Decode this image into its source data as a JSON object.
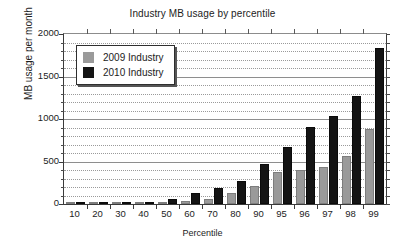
{
  "chart_data": {
    "type": "bar",
    "title": "Industry MB usage by percentile",
    "xlabel": "Percentile",
    "ylabel": "MB usage per month",
    "categories": [
      "10",
      "20",
      "30",
      "40",
      "50",
      "60",
      "70",
      "80",
      "90",
      "95",
      "96",
      "97",
      "98",
      "99"
    ],
    "series": [
      {
        "name": "2009 Industry",
        "color": "#9a9a9a",
        "values": [
          3,
          5,
          9,
          14,
          22,
          33,
          55,
          125,
          210,
          375,
          405,
          435,
          570,
          880
        ]
      },
      {
        "name": "2010 Industry",
        "color": "#141414",
        "values": [
          5,
          8,
          18,
          28,
          60,
          125,
          190,
          270,
          465,
          670,
          910,
          1035,
          1265,
          1830
        ]
      }
    ],
    "ylim": [
      0,
      2000
    ],
    "y_major_ticks": [
      0,
      500,
      1000,
      1500,
      2000
    ],
    "y_minor_tick_step": 100,
    "grid": {
      "major_horizontal": true,
      "minor_horizontal_dotted": true,
      "vertical": false
    },
    "legend": {
      "position": "upper-left-inside",
      "entries": [
        "2009 Industry",
        "2010 Industry"
      ]
    },
    "axes": {
      "top_ticks": true,
      "right_minor_ticks": true
    }
  }
}
